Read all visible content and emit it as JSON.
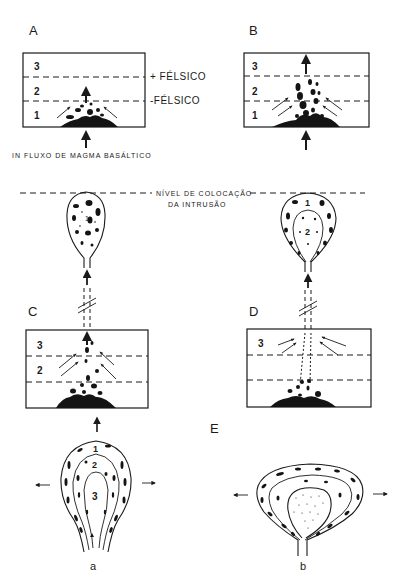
{
  "panels": {
    "A": {
      "letter": "A",
      "layers": [
        "3",
        "2",
        "1"
      ],
      "upper_boundary_label": "+ FÉLSICO",
      "lower_boundary_label": "-FÉLSICO",
      "caption": "IN FLUXO DE MAGMA BASÁLTICO"
    },
    "B": {
      "letter": "B",
      "layers": [
        "3",
        "2",
        "1"
      ]
    },
    "C": {
      "letter": "C",
      "layers": [
        "3",
        "2"
      ],
      "diapir_zones": [
        "1"
      ]
    },
    "D": {
      "letter": "D",
      "layers": [
        "3"
      ],
      "diapir_zones": [
        "1",
        "2"
      ]
    },
    "E": {
      "letter": "E",
      "sub_a": {
        "label": "a",
        "zones": [
          "1",
          "2",
          "3"
        ]
      },
      "sub_b": {
        "label": "b"
      }
    }
  },
  "emplacement_level": {
    "line1": "NÍVEL DE COLOCAÇÃO",
    "line2": "DA INTRUSÃO"
  },
  "colors": {
    "ink": "#1a1a1a",
    "paper": "#ffffff"
  }
}
